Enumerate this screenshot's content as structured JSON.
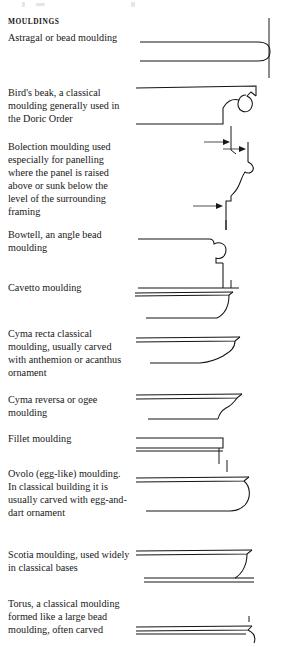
{
  "page": {
    "heading": "MOULDINGS",
    "width": 282,
    "height": 647,
    "background": "#ffffff",
    "ink_color": "#14141a"
  },
  "entries": [
    {
      "id": "astragal",
      "name": "astragal-or-bead-moulding",
      "caption": "Astragal or bead moulding",
      "profile": "bead",
      "description_short": "horizontal band terminating in a semicircular bead against a vertical wall"
    },
    {
      "id": "birds-beak",
      "name": "birds-beak-moulding",
      "caption": "Bird's beak, a classical moulding generally used in the Doric Order",
      "profile": "birds-beak",
      "description_short": "hooked beak profile with return curl at the top right"
    },
    {
      "id": "bolection",
      "name": "bolection-moulding",
      "caption": "Bolection moulding used especially for panelling where the panel is raised above or sunk below the level of the surrounding framing",
      "profile": "bolection",
      "arrows": 2,
      "description_short": "S-curved raised profile with two indicator arrows marking panel and framing levels"
    },
    {
      "id": "bowtell",
      "name": "bowtell-angle-bead-moulding",
      "caption": "Bowtell, an angle bead moulding",
      "profile": "bowtell",
      "description_short": "convex three-quarter round bead at an external angle"
    },
    {
      "id": "cavetto",
      "name": "cavetto-moulding",
      "caption": "Cavetto moulding",
      "profile": "cavetto",
      "description_short": "concave quarter-round hollow"
    },
    {
      "id": "cyma-recta",
      "name": "cyma-recta-moulding",
      "caption": "Cyma recta classical moulding, usually carved with anthemion or acanthus ornament",
      "profile": "cyma-recta",
      "description_short": "S-curve, concave above and convex below"
    },
    {
      "id": "cyma-reversa",
      "name": "cyma-reversa-ogee-moulding",
      "caption": "Cyma reversa or ogee moulding",
      "profile": "cyma-reversa",
      "description_short": "reversed S-curve, convex above and concave below"
    },
    {
      "id": "fillet",
      "name": "fillet-moulding",
      "caption": "Fillet moulding",
      "profile": "fillet",
      "description_short": "plain narrow flat band, square in section"
    },
    {
      "id": "ovolo",
      "name": "ovolo-moulding",
      "caption": "Ovolo (egg-like) moulding. In classical building it is usually carved with egg-and-dart ornament",
      "profile": "ovolo",
      "description_short": "convex quarter-round, egg shaped bulge"
    },
    {
      "id": "scotia",
      "name": "scotia-moulding",
      "caption": "Scotia moulding, used widely in classical bases",
      "profile": "scotia",
      "description_short": "deep concave hollow between two fillets"
    },
    {
      "id": "torus",
      "name": "torus-moulding",
      "caption": "Torus, a classical moulding formed like a large bead moulding, often carved",
      "profile": "torus",
      "clipped": true,
      "description_short": "large convex bead, drawing cropped by the page edge"
    }
  ]
}
